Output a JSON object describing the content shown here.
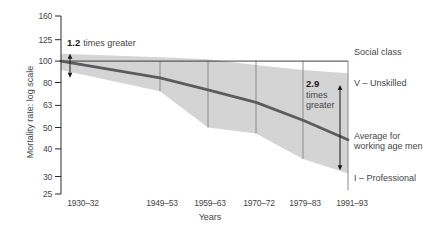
{
  "colors": {
    "background": "#ffffff",
    "band": "#d4d4d4",
    "average_line": "#5c5c5e",
    "whisker": "#8a8a8d",
    "axis": "#2b2b2b",
    "text": "#454548",
    "annotation": "#1a1a1a"
  },
  "chart_data": {
    "type": "area",
    "xlabel": "Years",
    "ylabel": "Mortality rate: log scale",
    "yscale": "log",
    "ylim": [
      25,
      160
    ],
    "yticks": [
      160,
      125,
      100,
      80,
      63,
      50,
      40,
      30,
      25
    ],
    "categories": [
      "1930–32",
      "1949–53",
      "1959–63",
      "1970–72",
      "1979–83",
      "1991–93"
    ],
    "series": [
      {
        "name": "V – Unskilled",
        "role": "band-top",
        "values": [
          108,
          104,
          102,
          96,
          91,
          88
        ]
      },
      {
        "name": "Average for working age men",
        "role": "center-line",
        "values": [
          100,
          84,
          74,
          65,
          54,
          44
        ]
      },
      {
        "name": "I – Professional",
        "role": "band-bottom",
        "values": [
          91,
          73,
          50,
          47,
          36,
          31
        ]
      }
    ],
    "whiskers": {
      "first_category_index": 1,
      "top_value": 100,
      "bottom_values": [
        73,
        50,
        47,
        36,
        26
      ]
    },
    "reference_line_value": 100,
    "legend": {
      "header": "Social class",
      "top_label": "V – Unskilled",
      "middle_label": "Average for working age men",
      "bottom_label": "I – Professional"
    },
    "annotations": [
      {
        "id": "gap-1930-32",
        "bold": "1.2",
        "rest": "times greater",
        "arrow_top_value": 108,
        "arrow_bottom_value": 84
      },
      {
        "id": "gap-1991-93",
        "bold": "2.9",
        "rest": "times greater",
        "arrow_top_value": 78,
        "arrow_bottom_value": 32
      }
    ],
    "layout_hints": {
      "grid": false,
      "legend_position": "right",
      "plot_top_px": 16,
      "plot_bottom_px": 194,
      "axis_x_px": 61,
      "plot_right_px": 348,
      "x_px": [
        61,
        160,
        208,
        256,
        303,
        348
      ],
      "xlabel_centers_px": [
        83,
        162,
        210,
        259,
        305,
        352
      ],
      "xlabel_baseline_px": 206,
      "annotation_arrow_x_px": [
        70,
        340
      ]
    }
  }
}
